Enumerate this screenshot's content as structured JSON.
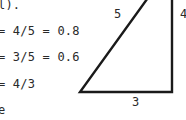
{
  "text_lines": [
    "l).",
    "= 4/5 = 0.8",
    "= 3/5 = 0.6",
    "= 4/3",
    "e"
  ],
  "triangle": {
    "hypotenuse_label": "5",
    "vertical_label": "4",
    "base_label": "3",
    "stroke_color": "#1a1a1a"
  }
}
